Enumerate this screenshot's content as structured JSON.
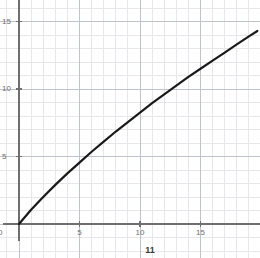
{
  "chart_data": {
    "type": "line",
    "title": "",
    "subtitle": "",
    "xlabel": "",
    "ylabel": "",
    "caption": "11",
    "xlim": [
      0,
      19.7
    ],
    "ylim": [
      0,
      16.6
    ],
    "x_ticks": [
      5,
      10,
      15
    ],
    "x_tick_labels": [
      "5",
      "10",
      "15"
    ],
    "y_ticks": [
      5,
      10,
      15
    ],
    "y_tick_labels": [
      "5",
      "10",
      "15"
    ],
    "origin_label": "0",
    "grid": true,
    "minor_grid": true,
    "major_grid_step": 5,
    "minor_grid_step": 1,
    "legend": null,
    "series": [
      {
        "name": "curve",
        "x": [
          0,
          1,
          2,
          3,
          4,
          5,
          6,
          7,
          8,
          9,
          10,
          11,
          12,
          13,
          14,
          15,
          16,
          17,
          18,
          19,
          19.7
        ],
        "y": [
          0,
          1.05,
          2.0,
          2.9,
          3.75,
          4.55,
          5.35,
          6.1,
          6.85,
          7.55,
          8.25,
          8.95,
          9.6,
          10.25,
          10.9,
          11.5,
          12.1,
          12.7,
          13.3,
          13.9,
          14.3
        ],
        "color": "#1a1a1a",
        "width": 2.2
      }
    ],
    "colors": {
      "axis": "#6f6f6f",
      "major_grid": "#bfc3cc",
      "minor_grid": "#e8e6ea",
      "line": "#1a1a1a",
      "tick_text": "#6e6e6e",
      "caption_text": "#3a3a3a",
      "background": "#ffffff"
    }
  },
  "geometry": {
    "origin_px": {
      "x": 19,
      "y": 224
    },
    "unit_px": {
      "x": 12.1,
      "y": 13.5
    },
    "y_axis_top_px": 0,
    "y_axis_bottom_px": 241,
    "x_axis_left_px": 3,
    "x_axis_right_px": 260,
    "caption_px": {
      "x": 150,
      "y": 246
    }
  }
}
